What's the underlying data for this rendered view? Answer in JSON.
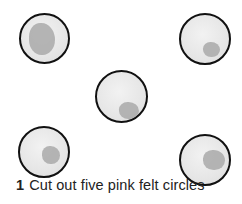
{
  "illustration": {
    "circles": [
      {
        "id": "top-left",
        "x": 19,
        "y": 13,
        "size": 51,
        "spot": {
          "x": 8,
          "y": 8,
          "w": 26,
          "h": 32
        }
      },
      {
        "id": "top-right",
        "x": 179,
        "y": 13,
        "size": 52,
        "spot": {
          "x": 22,
          "y": 27,
          "w": 17,
          "h": 15
        }
      },
      {
        "id": "middle",
        "x": 95,
        "y": 70,
        "size": 53,
        "spot": {
          "x": 22,
          "y": 30,
          "w": 20,
          "h": 17
        }
      },
      {
        "id": "bottom-left",
        "x": 18,
        "y": 126,
        "size": 52,
        "spot": {
          "x": 22,
          "y": 18,
          "w": 18,
          "h": 18
        }
      },
      {
        "id": "bottom-right",
        "x": 179,
        "y": 134,
        "size": 52,
        "spot": {
          "x": 22,
          "y": 14,
          "w": 22,
          "h": 20
        }
      }
    ],
    "colors": {
      "outline": "#111111",
      "felt": "#e6e6e6",
      "shade": "#a9a9a9"
    }
  },
  "caption": {
    "step_number": "1",
    "text": "Cut out five pink felt circles"
  }
}
